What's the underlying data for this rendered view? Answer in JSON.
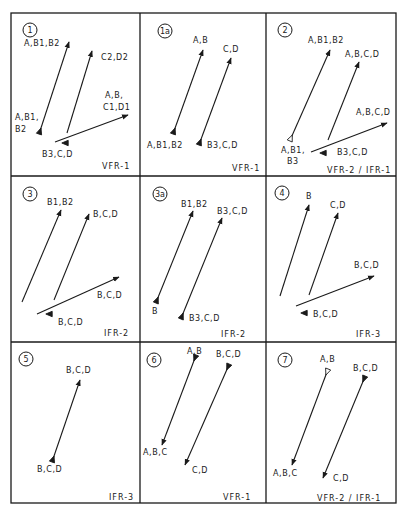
{
  "figure": {
    "grid": {
      "left": 11,
      "right": 396,
      "top": 13,
      "bottom": 503,
      "col_dividers": [
        140,
        266
      ],
      "row_dividers": [
        176,
        342
      ]
    },
    "colors": {
      "ink": "#1a1a1a",
      "background": "#ffffff"
    },
    "panels": [
      {
        "id": "1",
        "caption": "VFR-1",
        "badge": {
          "text": "1",
          "x": 30,
          "y": 30
        },
        "caption_pos": {
          "x": 102,
          "y": 169
        },
        "arrows": [
          {
            "x1": 40,
            "y1": 131,
            "x2": 69,
            "y2": 42,
            "tail": "filled"
          },
          {
            "x1": 67,
            "y1": 133,
            "x2": 92,
            "y2": 51,
            "tail": "none"
          },
          {
            "x1": 55,
            "y1": 142,
            "x2": 128,
            "y2": 115,
            "tail": "none"
          }
        ],
        "markers": [
          {
            "x": 65,
            "y": 143,
            "type": "filled"
          }
        ],
        "labels": [
          {
            "text": "A,B1,B2",
            "x": 24,
            "y": 46
          },
          {
            "text": "C2,D2",
            "x": 101,
            "y": 60
          },
          {
            "text": "A,B,",
            "x": 105,
            "y": 98
          },
          {
            "text": "C1,D1",
            "x": 103,
            "y": 110
          },
          {
            "text": "A,B1,",
            "x": 15,
            "y": 120
          },
          {
            "text": "B2",
            "x": 15,
            "y": 132
          },
          {
            "text": "B3,C,D",
            "x": 42,
            "y": 157
          }
        ]
      },
      {
        "id": "1a",
        "caption": "VFR-1",
        "badge": {
          "text": "1a",
          "x": 165,
          "y": 31
        },
        "caption_pos": {
          "x": 232,
          "y": 171
        },
        "arrows": [
          {
            "x1": 174,
            "y1": 131,
            "x2": 203,
            "y2": 50,
            "tail": "filled"
          },
          {
            "x1": 200,
            "y1": 142,
            "x2": 231,
            "y2": 58,
            "tail": "filled"
          }
        ],
        "markers": [],
        "labels": [
          {
            "text": "A,B",
            "x": 193,
            "y": 43
          },
          {
            "text": "C,D",
            "x": 223,
            "y": 52
          },
          {
            "text": "A,B1,B2",
            "x": 147,
            "y": 148
          },
          {
            "text": "B3,C,D",
            "x": 207,
            "y": 148
          }
        ]
      },
      {
        "id": "2",
        "caption": "VFR-2 / IFR-1",
        "badge": {
          "text": "2",
          "x": 285,
          "y": 30
        },
        "caption_pos": {
          "x": 327,
          "y": 173
        },
        "arrows": [
          {
            "x1": 291,
            "y1": 138,
            "x2": 330,
            "y2": 50,
            "tail": "open"
          },
          {
            "x1": 328,
            "y1": 140,
            "x2": 359,
            "y2": 62,
            "tail": "none"
          },
          {
            "x1": 311,
            "y1": 152,
            "x2": 387,
            "y2": 123,
            "tail": "none"
          }
        ],
        "markers": [
          {
            "x": 323,
            "y": 153,
            "type": "filled"
          }
        ],
        "labels": [
          {
            "text": "A,B1,B2",
            "x": 308,
            "y": 43
          },
          {
            "text": "A,B,C,D",
            "x": 345,
            "y": 57
          },
          {
            "text": "A,B,C,D",
            "x": 356,
            "y": 115
          },
          {
            "text": "A,B1,",
            "x": 281,
            "y": 153
          },
          {
            "text": "B3",
            "x": 287,
            "y": 164
          },
          {
            "text": "B3,C,D",
            "x": 337,
            "y": 155
          }
        ]
      },
      {
        "id": "3",
        "caption": "IFR-2",
        "badge": {
          "text": "3",
          "x": 30,
          "y": 194
        },
        "caption_pos": {
          "x": 104,
          "y": 336
        },
        "arrows": [
          {
            "x1": 22,
            "y1": 302,
            "x2": 61,
            "y2": 210,
            "tail": "none"
          },
          {
            "x1": 54,
            "y1": 300,
            "x2": 89,
            "y2": 214,
            "tail": "none"
          },
          {
            "x1": 37,
            "y1": 314,
            "x2": 119,
            "y2": 277,
            "tail": "none"
          }
        ],
        "markers": [
          {
            "x": 49,
            "y": 314,
            "type": "filled"
          }
        ],
        "labels": [
          {
            "text": "B1,B2",
            "x": 47,
            "y": 205
          },
          {
            "text": "B,C,D",
            "x": 93,
            "y": 217
          },
          {
            "text": "B,C,D",
            "x": 97,
            "y": 298
          },
          {
            "text": "B,C,D",
            "x": 58,
            "y": 325
          }
        ]
      },
      {
        "id": "3a",
        "caption": "IFR-2",
        "badge": {
          "text": "3a",
          "x": 160,
          "y": 194
        },
        "caption_pos": {
          "x": 221,
          "y": 337
        },
        "arrows": [
          {
            "x1": 157,
            "y1": 300,
            "x2": 193,
            "y2": 211,
            "tail": "filled"
          },
          {
            "x1": 182,
            "y1": 316,
            "x2": 222,
            "y2": 218,
            "tail": "filled"
          }
        ],
        "markers": [],
        "labels": [
          {
            "text": "B1,B2",
            "x": 181,
            "y": 207
          },
          {
            "text": "B3,C,D",
            "x": 217,
            "y": 214
          },
          {
            "text": "B",
            "x": 152,
            "y": 314
          },
          {
            "text": "B3,C,D",
            "x": 189,
            "y": 321
          }
        ]
      },
      {
        "id": "4",
        "caption": "IFR-3",
        "badge": {
          "text": "4",
          "x": 282,
          "y": 193
        },
        "caption_pos": {
          "x": 356,
          "y": 337
        },
        "arrows": [
          {
            "x1": 280,
            "y1": 296,
            "x2": 309,
            "y2": 205,
            "tail": "none"
          },
          {
            "x1": 309,
            "y1": 295,
            "x2": 338,
            "y2": 213,
            "tail": "none"
          },
          {
            "x1": 296,
            "y1": 306,
            "x2": 374,
            "y2": 276,
            "tail": "none"
          }
        ],
        "markers": [
          {
            "x": 304,
            "y": 313,
            "type": "filled"
          }
        ],
        "labels": [
          {
            "text": "B",
            "x": 306,
            "y": 199
          },
          {
            "text": "C,D",
            "x": 330,
            "y": 208
          },
          {
            "text": "B,C,D",
            "x": 354,
            "y": 268
          },
          {
            "text": "B,C,D",
            "x": 313,
            "y": 317
          }
        ]
      },
      {
        "id": "5",
        "caption": "IFR-3",
        "badge": {
          "text": "5",
          "x": 26,
          "y": 359
        },
        "caption_pos": {
          "x": 109,
          "y": 500
        },
        "arrows": [
          {
            "x1": 53,
            "y1": 459,
            "x2": 80,
            "y2": 380,
            "tail": "filled"
          }
        ],
        "markers": [],
        "labels": [
          {
            "text": "B,C,D",
            "x": 66,
            "y": 373
          },
          {
            "text": "B,C,D",
            "x": 37,
            "y": 472
          }
        ]
      },
      {
        "id": "6",
        "caption": "VFR-1",
        "badge": {
          "text": "6",
          "x": 154,
          "y": 360
        },
        "caption_pos": {
          "x": 223,
          "y": 500
        },
        "arrows": [
          {
            "x1": 195,
            "y1": 358,
            "x2": 162,
            "y2": 445,
            "tail": "filled-down"
          },
          {
            "x1": 228,
            "y1": 367,
            "x2": 185,
            "y2": 465,
            "tail": "filled-down"
          }
        ],
        "markers": [],
        "labels": [
          {
            "text": "A,B",
            "x": 187,
            "y": 354
          },
          {
            "text": "B,C,D",
            "x": 216,
            "y": 357
          },
          {
            "text": "A,B,C",
            "x": 143,
            "y": 455
          },
          {
            "text": "C,D",
            "x": 192,
            "y": 473
          }
        ]
      },
      {
        "id": "7",
        "caption": "VFR-2 / IFR-1",
        "badge": {
          "text": "7",
          "x": 285,
          "y": 360
        },
        "caption_pos": {
          "x": 317,
          "y": 501
        },
        "arrows": [
          {
            "x1": 327,
            "y1": 372,
            "x2": 292,
            "y2": 465,
            "tail": "open-down"
          },
          {
            "x1": 364,
            "y1": 379,
            "x2": 323,
            "y2": 478,
            "tail": "filled-down"
          }
        ],
        "markers": [],
        "labels": [
          {
            "text": "A,B",
            "x": 320,
            "y": 362
          },
          {
            "text": "B,C,D",
            "x": 353,
            "y": 371
          },
          {
            "text": "A,B,C",
            "x": 273,
            "y": 476
          },
          {
            "text": "C,D",
            "x": 333,
            "y": 481
          }
        ]
      }
    ]
  }
}
